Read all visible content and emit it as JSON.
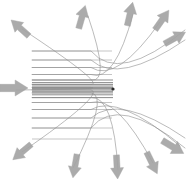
{
  "figure": {
    "width": 189,
    "height": 182,
    "background_color": "#ffffff"
  },
  "colors": {
    "trajectory_line": "#8a8a8a",
    "beam_core_line": "#6e6e6e",
    "arrow_fill": "#a3a3a3",
    "arrow_stroke": "#9a9a9a",
    "nucleus": "#2b2b2b",
    "background": "#ffffff"
  },
  "nucleus": {
    "label": "scattering-nucleus",
    "x": 113.0,
    "y": 89.0,
    "radius": 1.6
  },
  "incoming_beam": {
    "label": "incident-particle-beam",
    "direction": "left-to-right",
    "arrow": {
      "x": 14,
      "y": 88,
      "angle_deg": 0,
      "length": 28,
      "width": 16
    },
    "line_start_x": 32,
    "impact_parameters": [
      -38.0,
      -29.0,
      -21.5,
      -14.5,
      -9.0,
      -6.4,
      -4.6,
      -3.0,
      -1.6,
      -0.4,
      0.9,
      2.3,
      3.9,
      5.8,
      8.6,
      13.5,
      20.5,
      29.0,
      39.0,
      50.0
    ]
  },
  "trajectories": [
    {
      "id": 1,
      "impact_parameter": -38.0,
      "start_y": 51.0,
      "scatter_angle_deg": -31,
      "exit_point": {
        "x": 185,
        "y": 30
      }
    },
    {
      "id": 2,
      "impact_parameter": -29.0,
      "start_y": 60.0,
      "scatter_angle_deg": -25,
      "exit_point": {
        "x": 185,
        "y": 40
      }
    },
    {
      "id": 3,
      "impact_parameter": -21.5,
      "start_y": 67.5,
      "scatter_angle_deg": -40,
      "exit_point": {
        "x": 160,
        "y": 22
      }
    },
    {
      "id": 4,
      "impact_parameter": -14.5,
      "start_y": 74.5,
      "scatter_angle_deg": -57,
      "exit_point": {
        "x": 133,
        "y": 14
      }
    },
    {
      "id": 5,
      "impact_parameter": -9.0,
      "start_y": 80.0,
      "scatter_angle_deg": -72,
      "exit_point": {
        "x": 88,
        "y": 16
      }
    },
    {
      "id": 6,
      "impact_parameter": -4.6,
      "start_y": 84.4,
      "scatter_angle_deg": -128,
      "exit_point": {
        "x": 22,
        "y": 29
      }
    },
    {
      "id": 7,
      "impact_parameter": -1.6,
      "start_y": 87.4,
      "scatter_angle_deg": -150,
      "exit_point": {
        "x": 16,
        "y": 90
      }
    },
    {
      "id": 8,
      "impact_parameter": 0.9,
      "start_y": 89.9,
      "scatter_angle_deg": 152,
      "exit_point": {
        "x": 22,
        "y": 152
      }
    },
    {
      "id": 9,
      "impact_parameter": 3.9,
      "start_y": 92.9,
      "scatter_angle_deg": 118,
      "exit_point": {
        "x": 73,
        "y": 168
      }
    },
    {
      "id": 10,
      "impact_parameter": 8.6,
      "start_y": 97.6,
      "scatter_angle_deg": 93,
      "exit_point": {
        "x": 118,
        "y": 170
      }
    },
    {
      "id": 11,
      "impact_parameter": 13.5,
      "start_y": 102.5,
      "scatter_angle_deg": 70,
      "exit_point": {
        "x": 153,
        "y": 163
      }
    },
    {
      "id": 12,
      "impact_parameter": 20.5,
      "start_y": 109.5,
      "scatter_angle_deg": 42,
      "exit_point": {
        "x": 180,
        "y": 146
      }
    },
    {
      "id": 13,
      "impact_parameter": 29.0,
      "start_y": 118.0,
      "scatter_angle_deg": 26,
      "exit_point": {
        "x": 185,
        "y": 138
      }
    },
    {
      "id": 14,
      "impact_parameter": 39.0,
      "start_y": 128.0,
      "scatter_angle_deg": 16,
      "exit_point": {
        "x": 185,
        "y": 148
      }
    }
  ],
  "outgoing_arrows": [
    {
      "name": "arrow-up-left",
      "x": 20,
      "y": 28,
      "angle_deg": 222,
      "length": 24,
      "width": 13
    },
    {
      "name": "arrow-top-left",
      "x": 82,
      "y": 17,
      "angle_deg": 286,
      "length": 24,
      "width": 13
    },
    {
      "name": "arrow-top-center",
      "x": 130,
      "y": 14,
      "angle_deg": 283,
      "length": 24,
      "width": 13
    },
    {
      "name": "arrow-top-right",
      "x": 162,
      "y": 20,
      "angle_deg": 305,
      "length": 24,
      "width": 13
    },
    {
      "name": "arrow-right-upper",
      "x": 175,
      "y": 38,
      "angle_deg": 331,
      "length": 24,
      "width": 13
    },
    {
      "name": "arrow-right-lower",
      "x": 173,
      "y": 147,
      "angle_deg": 31,
      "length": 25,
      "width": 14
    },
    {
      "name": "arrow-bottom-right",
      "x": 152,
      "y": 163,
      "angle_deg": 64,
      "length": 24,
      "width": 13
    },
    {
      "name": "arrow-bottom-center",
      "x": 117,
      "y": 167,
      "angle_deg": 87,
      "length": 24,
      "width": 13
    },
    {
      "name": "arrow-bottom-left",
      "x": 75,
      "y": 166,
      "angle_deg": 100,
      "length": 24,
      "width": 13
    },
    {
      "name": "arrow-down-left",
      "x": 22,
      "y": 152,
      "angle_deg": 140,
      "length": 24,
      "width": 13
    }
  ],
  "chart_data": {
    "type": "scatter",
    "xlabel": "",
    "ylabel": "",
    "xlim": [
      0,
      189
    ],
    "ylim": [
      182,
      0
    ],
    "grid": false,
    "legend": "none",
    "annotations": [
      "incident parallel beam from left",
      "central scattering nucleus",
      "deflected trajectories radiating outward"
    ],
    "series": [
      {
        "name": "incident beam lines",
        "count": 20,
        "x": [
          32,
          113
        ],
        "description": "Parallel horizontal rays converging on the nucleus"
      },
      {
        "name": "scattered trajectories",
        "count": 14,
        "description": "Hyperbolic deflected paths leaving the nucleus at angles from 16 to 222 degrees"
      }
    ]
  }
}
